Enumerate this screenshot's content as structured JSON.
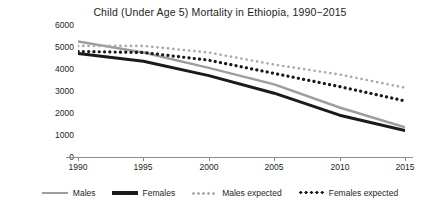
{
  "chart_data": {
    "type": "line",
    "title": "Child (Under Age 5) Mortality in Ethiopia, 1990−2015",
    "xlabel": "",
    "ylabel": "Rate per 100,000",
    "x": [
      1990,
      1995,
      2000,
      2005,
      2010,
      2015
    ],
    "xticklabels": [
      "1990",
      "1995",
      "2000",
      "2005",
      "2010",
      "2015"
    ],
    "yticklabels": [
      "0",
      "1000",
      "2000",
      "3000",
      "4000",
      "5000",
      "6000"
    ],
    "ytickvalues": [
      0,
      1000,
      2000,
      3000,
      4000,
      5000,
      6000
    ],
    "xlim": [
      1990,
      2015
    ],
    "ylim": [
      0,
      6000
    ],
    "grid": false,
    "legend_position": "bottom",
    "series": [
      {
        "name": "Males",
        "style": "solid",
        "color": "#9d9d9d",
        "values": [
          5250,
          4750,
          4050,
          3300,
          2250,
          1350
        ]
      },
      {
        "name": "Females",
        "style": "solid",
        "color": "#1a1a1a",
        "values": [
          4700,
          4350,
          3700,
          2900,
          1900,
          1200
        ]
      },
      {
        "name": "Males expected",
        "style": "dotted",
        "color": "#a8a8a8",
        "values": [
          5050,
          5050,
          4750,
          4200,
          3750,
          3150
        ]
      },
      {
        "name": "Females expected",
        "style": "dotted",
        "color": "#1a1a1a",
        "values": [
          4800,
          4750,
          4400,
          3800,
          3200,
          2550
        ]
      }
    ]
  },
  "legend": {
    "items": [
      {
        "label": "Males",
        "swatch": "solid-gray-line-swatch"
      },
      {
        "label": "Females",
        "swatch": "solid-black-line-swatch"
      },
      {
        "label": "Males expected",
        "swatch": "dotted-gray-line-swatch"
      },
      {
        "label": "Females expected",
        "swatch": "dotted-black-line-swatch"
      }
    ]
  }
}
